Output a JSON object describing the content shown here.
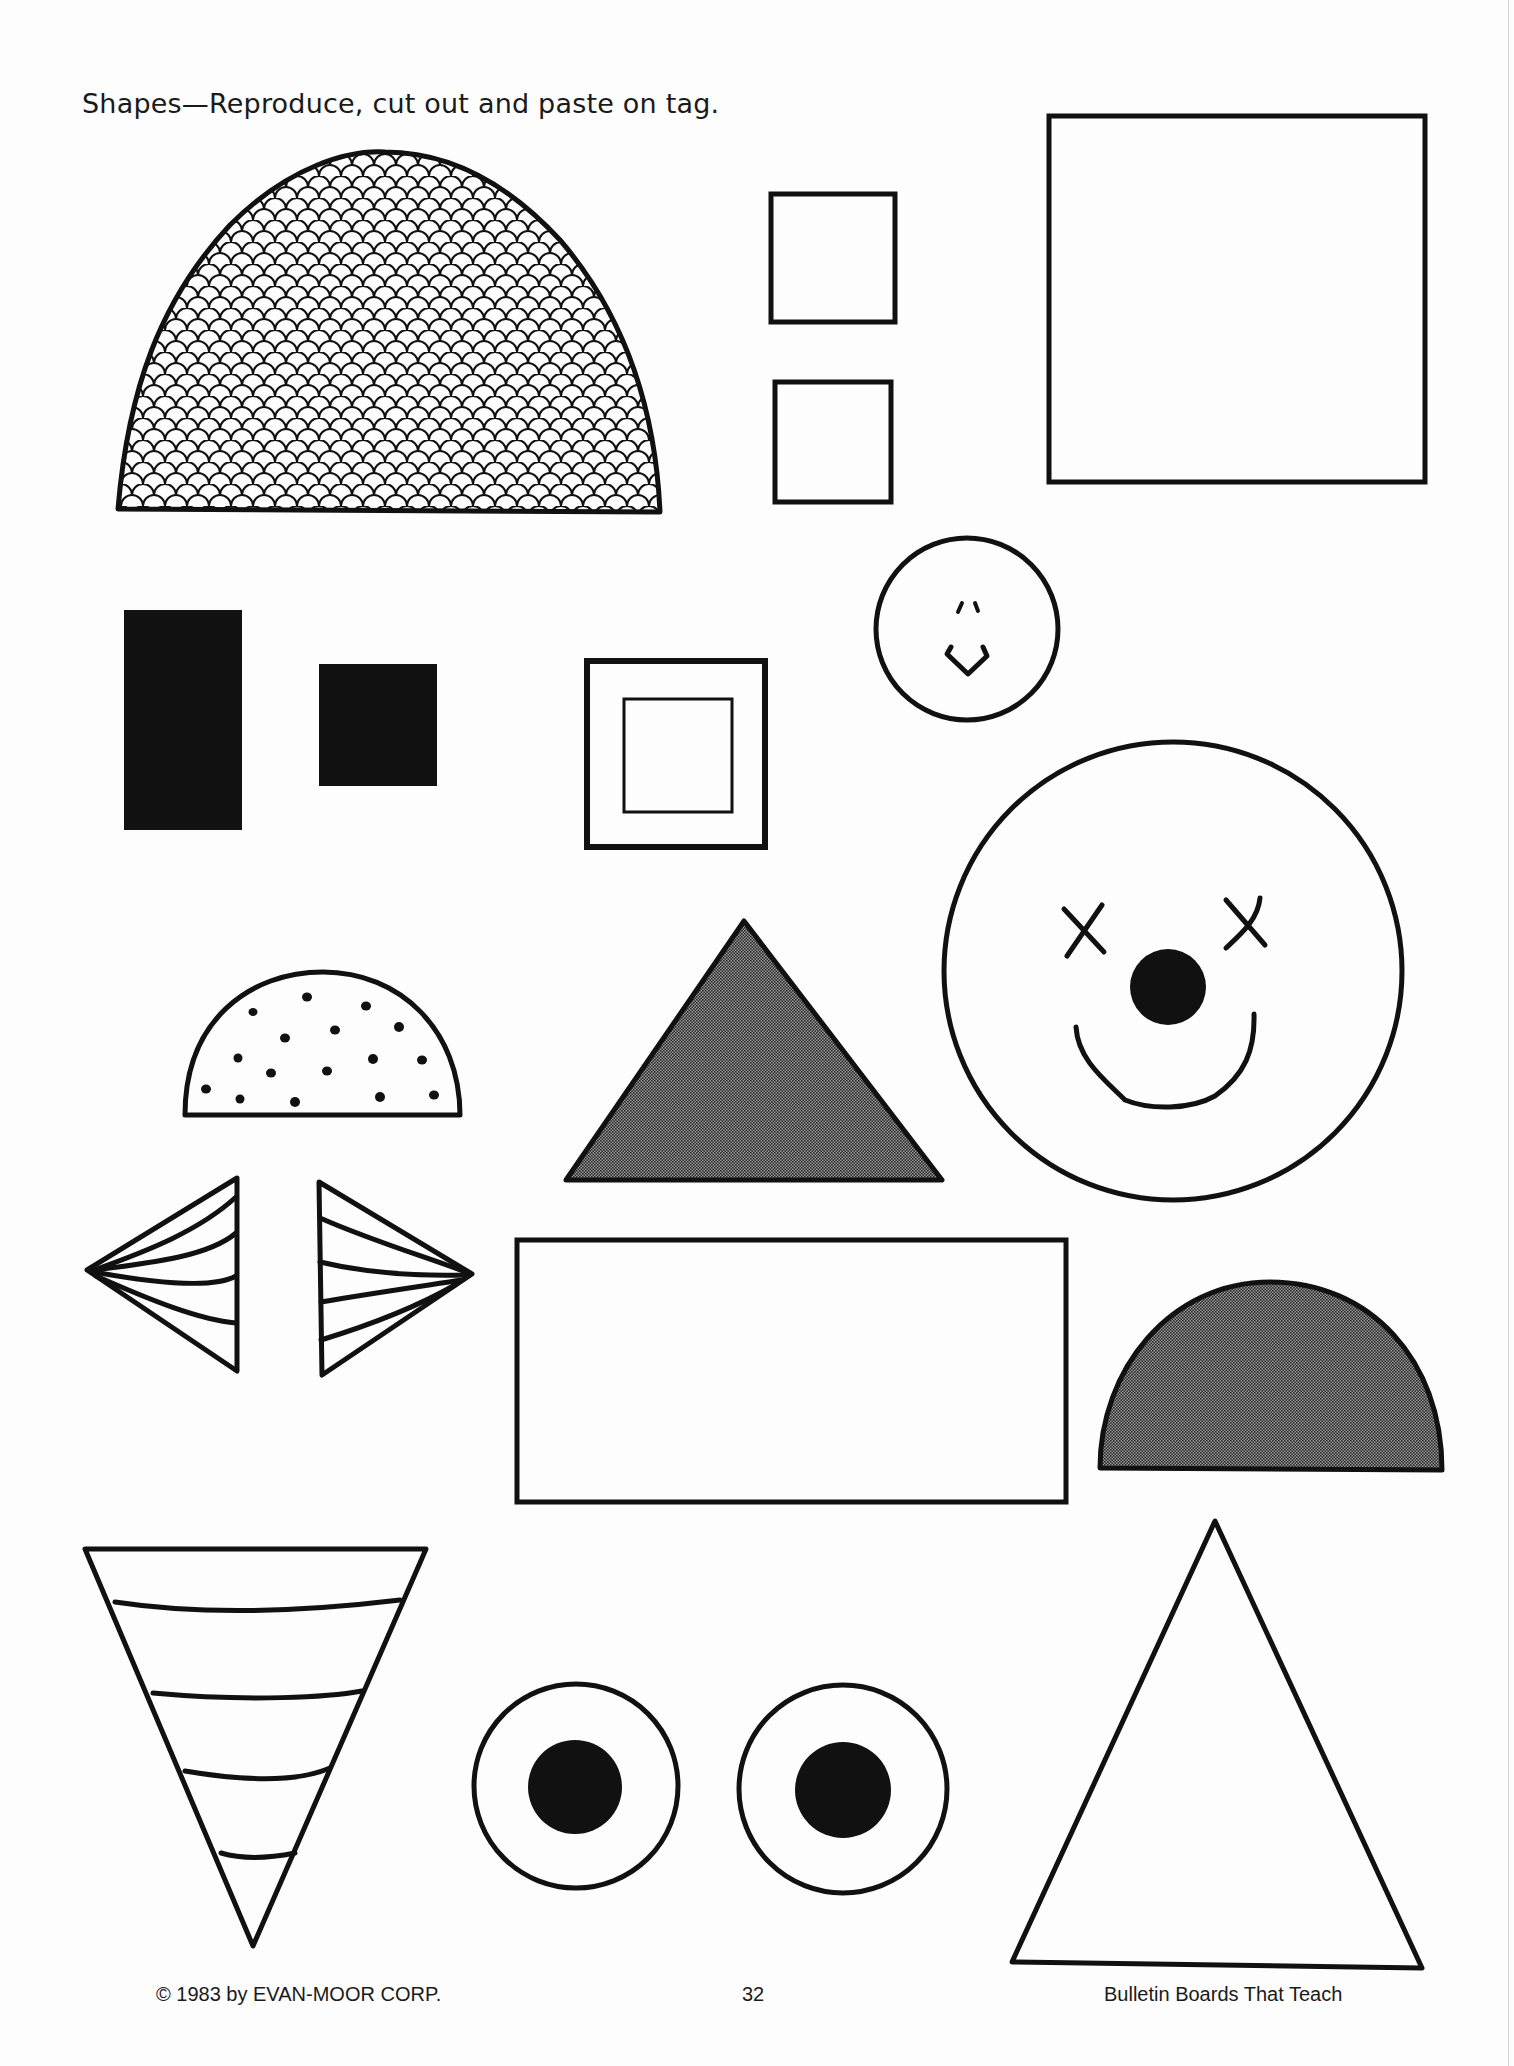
{
  "page": {
    "heading": "Shapes—Reproduce, cut out and paste on tag.",
    "footer": {
      "copyright": "© 1983 by EVAN-MOOR CORP.",
      "page_number": "32",
      "book_title": "Bulletin Boards That Teach"
    }
  },
  "colors": {
    "ink": "#111111",
    "paper": "#fdfdfd",
    "halftone_gray": "#6a6a6a"
  },
  "shapes": [
    {
      "id": "scalloped-dome",
      "type": "half-ellipse",
      "fill": "scale-pattern"
    },
    {
      "id": "small-square-top",
      "type": "square",
      "fill": "none"
    },
    {
      "id": "small-square-bottom",
      "type": "square",
      "fill": "none"
    },
    {
      "id": "large-square",
      "type": "square",
      "fill": "none"
    },
    {
      "id": "tall-black-rectangle",
      "type": "rectangle",
      "fill": "black"
    },
    {
      "id": "small-black-square",
      "type": "square",
      "fill": "black"
    },
    {
      "id": "framed-square",
      "type": "square-in-square",
      "fill": "none"
    },
    {
      "id": "small-smiley-face",
      "type": "circle",
      "fill": "none"
    },
    {
      "id": "clown-face",
      "type": "circle",
      "fill": "none"
    },
    {
      "id": "dotted-half-circle",
      "type": "half-circle",
      "fill": "dots"
    },
    {
      "id": "gray-triangle",
      "type": "triangle",
      "fill": "gray"
    },
    {
      "id": "left-bow-wing",
      "type": "triangle",
      "fill": "pleats"
    },
    {
      "id": "right-bow-wing",
      "type": "triangle",
      "fill": "pleats"
    },
    {
      "id": "wide-rectangle",
      "type": "rectangle",
      "fill": "none"
    },
    {
      "id": "gray-half-circle",
      "type": "half-circle",
      "fill": "gray"
    },
    {
      "id": "striped-cone",
      "type": "inverted-triangle",
      "fill": "stripes"
    },
    {
      "id": "left-eye",
      "type": "circle-with-pupil",
      "fill": "none"
    },
    {
      "id": "right-eye",
      "type": "circle-with-pupil",
      "fill": "none"
    },
    {
      "id": "large-triangle",
      "type": "triangle",
      "fill": "none"
    }
  ]
}
